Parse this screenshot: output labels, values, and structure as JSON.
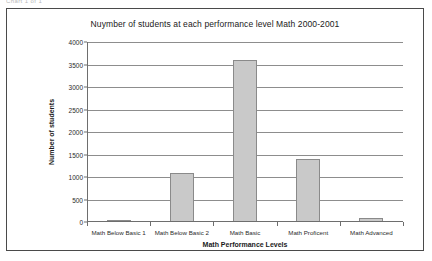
{
  "scrap_text": "Chart 1 of 1",
  "chart_data": {
    "type": "bar",
    "title": "Nuymber of students at each performance level Math 2000-2001",
    "xlabel": "Math Performance Levels",
    "ylabel": "Number of students",
    "categories": [
      "Math Below Basic 1",
      "Math Below Basic 2",
      "Math Basic",
      "Math Proficent",
      "Math Advanced"
    ],
    "values": [
      25,
      1100,
      3600,
      1400,
      80
    ],
    "ylim": [
      0,
      4000
    ],
    "yticks": [
      0,
      500,
      1000,
      1500,
      2000,
      2500,
      3000,
      3500,
      4000
    ],
    "ytick_labels": [
      "0",
      "500",
      "1000",
      "1500",
      "2000",
      "2500",
      "3000",
      "3500",
      "4000"
    ],
    "grid": true,
    "legend": false,
    "bar_color": "#c9c9c9",
    "bar_edge_color": "#8a8a8a"
  }
}
